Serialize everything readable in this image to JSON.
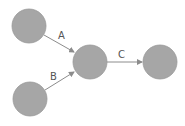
{
  "diagram": {
    "colors": {
      "node_fill": "#a6a6a6",
      "edge": "#8c8c8c",
      "label": "#555555"
    },
    "nodes": [
      {
        "id": "n1",
        "cx": 29,
        "cy": 26,
        "r": 17
      },
      {
        "id": "n2",
        "cx": 30,
        "cy": 99,
        "r": 17
      },
      {
        "id": "n3",
        "cx": 90,
        "cy": 62,
        "r": 17
      },
      {
        "id": "n4",
        "cx": 160,
        "cy": 62,
        "r": 17
      }
    ],
    "edges": [
      {
        "from": "n1",
        "to": "n3",
        "label": "A"
      },
      {
        "from": "n2",
        "to": "n3",
        "label": "B"
      },
      {
        "from": "n3",
        "to": "n4",
        "label": "C"
      }
    ]
  }
}
